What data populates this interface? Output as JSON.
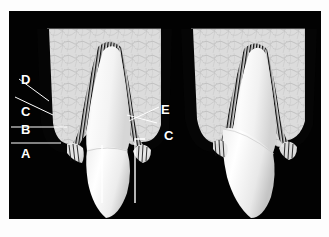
{
  "figure": {
    "background_color": "#020202",
    "page_color": "#ffffff",
    "bone_color": "#d8d8d8",
    "tooth_color": "#f2f2f2",
    "label_color": "#ffffff",
    "ligament_color": "#1a1a1a"
  },
  "panels": [
    {
      "id": "left-panel",
      "name": "labeled-tooth-panel",
      "caption": "",
      "labeled": true
    },
    {
      "id": "right-panel",
      "name": "unlabeled-tooth-panel",
      "caption": "",
      "labeled": false
    }
  ],
  "labels": [
    {
      "id": "label-d",
      "text": "D",
      "side": "left",
      "x": 12,
      "y": 70,
      "leader": "diagonal"
    },
    {
      "id": "label-c-left",
      "text": "C",
      "side": "left",
      "x": 12,
      "y": 102,
      "leader": "diagonal"
    },
    {
      "id": "label-b",
      "text": "B",
      "side": "left",
      "x": 12,
      "y": 122,
      "leader": "horizontal"
    },
    {
      "id": "label-a",
      "text": "A",
      "side": "left",
      "x": 12,
      "y": 146,
      "leader": "horizontal"
    },
    {
      "id": "label-e",
      "text": "E",
      "side": "right",
      "x": 152,
      "y": 100,
      "leader": "diagonal"
    },
    {
      "id": "label-c-right",
      "text": "C",
      "side": "right",
      "x": 155,
      "y": 128,
      "leader": "diagonal"
    }
  ],
  "markers": [
    {
      "id": "measurement-bracket",
      "name": "bracket-marker",
      "description": "white open bracket spanning below the left tooth"
    },
    {
      "id": "measurement-line",
      "name": "vertical-reference-line",
      "description": "white vertical reference line below the left tooth"
    }
  ]
}
